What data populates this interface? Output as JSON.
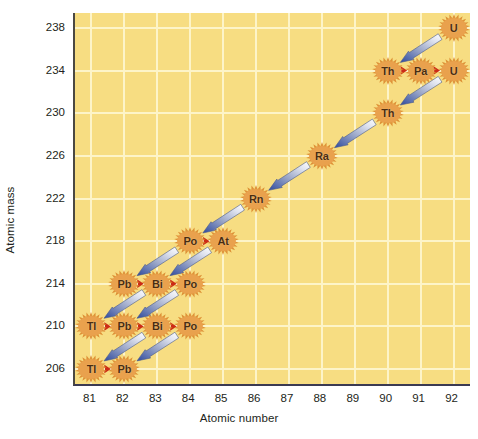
{
  "chart_data": {
    "type": "scatter",
    "title": "",
    "xlabel": "Atomic number",
    "ylabel": "Atomic mass",
    "xlim": [
      80.5,
      92.5
    ],
    "ylim": [
      204.6,
      239.4
    ],
    "xticks": [
      81,
      82,
      83,
      84,
      85,
      86,
      87,
      88,
      89,
      90,
      91,
      92
    ],
    "yticks": [
      206,
      210,
      214,
      218,
      222,
      226,
      230,
      234,
      238
    ],
    "grid": true,
    "legend": null,
    "colors": {
      "plot_background": "#f7dd82",
      "gridline": "#fdf4c8",
      "nuclide_burst": "#e2963c",
      "nuclide_text": "#4a2c10",
      "alpha_arrow_head": "#2e4a9e",
      "alpha_arrow_tail": "#e8eaf2",
      "beta_arrow": "#cc2b16",
      "axis": "#3b3a52",
      "tick_text": "#231f20"
    },
    "nuclides": [
      {
        "symbol": "U",
        "atomic_number": 92,
        "atomic_mass": 238
      },
      {
        "symbol": "Th",
        "atomic_number": 90,
        "atomic_mass": 234
      },
      {
        "symbol": "Pa",
        "atomic_number": 91,
        "atomic_mass": 234
      },
      {
        "symbol": "U",
        "atomic_number": 92,
        "atomic_mass": 234
      },
      {
        "symbol": "Th",
        "atomic_number": 90,
        "atomic_mass": 230
      },
      {
        "symbol": "Ra",
        "atomic_number": 88,
        "atomic_mass": 226
      },
      {
        "symbol": "Rn",
        "atomic_number": 86,
        "atomic_mass": 222
      },
      {
        "symbol": "Po",
        "atomic_number": 84,
        "atomic_mass": 218
      },
      {
        "symbol": "At",
        "atomic_number": 85,
        "atomic_mass": 218
      },
      {
        "symbol": "Pb",
        "atomic_number": 82,
        "atomic_mass": 214
      },
      {
        "symbol": "Bi",
        "atomic_number": 83,
        "atomic_mass": 214
      },
      {
        "symbol": "Po",
        "atomic_number": 84,
        "atomic_mass": 214
      },
      {
        "symbol": "Tl",
        "atomic_number": 81,
        "atomic_mass": 210
      },
      {
        "symbol": "Pb",
        "atomic_number": 82,
        "atomic_mass": 210
      },
      {
        "symbol": "Bi",
        "atomic_number": 83,
        "atomic_mass": 210
      },
      {
        "symbol": "Po",
        "atomic_number": 84,
        "atomic_mass": 210
      },
      {
        "symbol": "Tl",
        "atomic_number": 81,
        "atomic_mass": 206
      },
      {
        "symbol": "Pb",
        "atomic_number": 82,
        "atomic_mass": 206
      }
    ],
    "alpha_decays": [
      {
        "from": [
          92,
          238
        ],
        "to": [
          90,
          234
        ]
      },
      {
        "from": [
          92,
          234
        ],
        "to": [
          90,
          230
        ]
      },
      {
        "from": [
          90,
          230
        ],
        "to": [
          88,
          226
        ]
      },
      {
        "from": [
          88,
          226
        ],
        "to": [
          86,
          222
        ]
      },
      {
        "from": [
          86,
          222
        ],
        "to": [
          84,
          218
        ]
      },
      {
        "from": [
          85,
          218
        ],
        "to": [
          83,
          214
        ]
      },
      {
        "from": [
          84,
          218
        ],
        "to": [
          82,
          214
        ]
      },
      {
        "from": [
          84,
          214
        ],
        "to": [
          82,
          210
        ]
      },
      {
        "from": [
          83,
          214
        ],
        "to": [
          81,
          210
        ]
      },
      {
        "from": [
          84,
          210
        ],
        "to": [
          82,
          206
        ]
      },
      {
        "from": [
          83,
          210
        ],
        "to": [
          81,
          206
        ]
      }
    ],
    "beta_decays": [
      {
        "from": [
          90,
          234
        ],
        "to": [
          91,
          234
        ]
      },
      {
        "from": [
          91,
          234
        ],
        "to": [
          92,
          234
        ]
      },
      {
        "from": [
          84,
          218
        ],
        "to": [
          85,
          218
        ]
      },
      {
        "from": [
          82,
          214
        ],
        "to": [
          83,
          214
        ]
      },
      {
        "from": [
          83,
          214
        ],
        "to": [
          84,
          214
        ]
      },
      {
        "from": [
          81,
          210
        ],
        "to": [
          82,
          210
        ]
      },
      {
        "from": [
          82,
          210
        ],
        "to": [
          83,
          210
        ]
      },
      {
        "from": [
          83,
          210
        ],
        "to": [
          84,
          210
        ]
      },
      {
        "from": [
          81,
          206
        ],
        "to": [
          82,
          206
        ]
      }
    ]
  }
}
